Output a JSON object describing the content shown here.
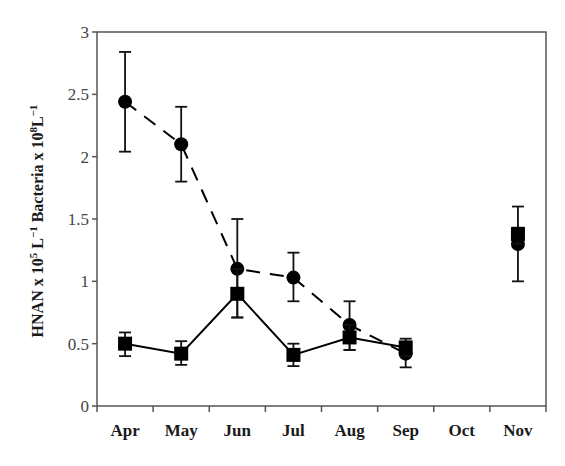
{
  "chart_data": {
    "type": "line",
    "title": "",
    "xlabel": "",
    "ylabel": "HNAN x 10^5 L^-1 Bacteria x 10^8 L^-1",
    "ylabel_parts": {
      "a": "HNAN x 10",
      "a_sup": "5",
      "b": " L",
      "b_sup": "−1",
      "c": " Bacteria x 10",
      "c_sup": "8",
      "d": "L",
      "d_sup": "−1"
    },
    "categories": [
      "Apr",
      "May",
      "Jun",
      "Jul",
      "Aug",
      "Sep",
      "Oct",
      "Nov"
    ],
    "ylim": [
      0,
      3
    ],
    "yticks": [
      0,
      0.5,
      1,
      1.5,
      2,
      2.5,
      3
    ],
    "ytick_labels": [
      "0",
      "0.5",
      "1",
      "1.5",
      "2",
      "2.5",
      "3"
    ],
    "grid": false,
    "legend": null,
    "series": [
      {
        "name": "Bacteria x 10^8 L^-1",
        "marker": "circle",
        "line_style": "dashed",
        "color": "#000000",
        "values": [
          2.44,
          2.1,
          1.1,
          1.03,
          0.65,
          0.42,
          null,
          1.3
        ],
        "error_low": [
          2.04,
          1.8,
          0.71,
          0.84,
          0.45,
          0.31,
          null,
          1.0
        ],
        "error_high": [
          2.84,
          2.4,
          1.5,
          1.23,
          0.84,
          0.47,
          null,
          1.6
        ]
      },
      {
        "name": "HNAN x 10^5 L^-1",
        "marker": "square",
        "line_style": "solid",
        "color": "#000000",
        "values": [
          0.5,
          0.42,
          0.9,
          0.41,
          0.55,
          0.47,
          null,
          1.38
        ],
        "error_low": [
          0.4,
          0.33,
          0.71,
          0.32,
          0.45,
          0.4,
          null,
          1.3
        ],
        "error_high": [
          0.59,
          0.52,
          1.1,
          0.5,
          0.65,
          0.54,
          null,
          1.43
        ]
      }
    ]
  }
}
